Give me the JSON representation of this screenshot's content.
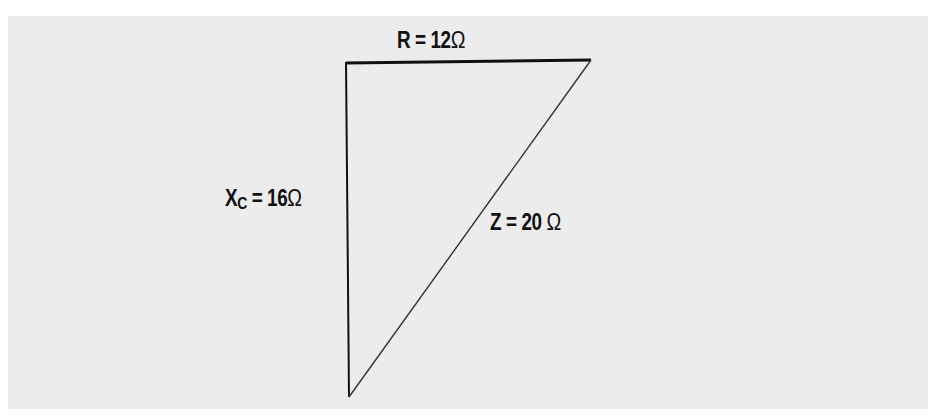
{
  "diagram": {
    "type": "impedance-triangle",
    "background_color": "#ececec",
    "line_color": "#111111",
    "sides": {
      "resistance": {
        "symbol": "R",
        "subscript": "",
        "equals": "=",
        "value": "12",
        "unit": "Ω"
      },
      "capacitive_reactance": {
        "symbol": "X",
        "subscript": "C",
        "equals": "=",
        "value": "16",
        "unit": "Ω"
      },
      "impedance": {
        "symbol": "Z",
        "subscript": "",
        "equals": "=",
        "value": "20",
        "unit": "Ω"
      }
    },
    "vertices": {
      "top_left": [
        346,
        63
      ],
      "top_right": [
        591,
        60
      ],
      "bottom": [
        349,
        397
      ]
    }
  }
}
